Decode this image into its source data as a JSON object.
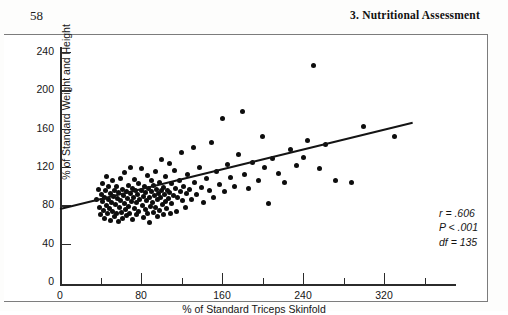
{
  "running_head": {
    "page_number": "58",
    "chapter_title": "3.  Nutritional Assessment"
  },
  "chart_data": {
    "type": "scatter",
    "title": "",
    "xlabel": "% of Standard Triceps Skinfold",
    "ylabel": "% of Standard Weight and Height",
    "xlim": [
      0,
      400
    ],
    "ylim": [
      0,
      240
    ],
    "xticks": [
      0,
      80,
      160,
      240,
      320
    ],
    "xticks_minor": [
      40,
      120,
      200,
      280,
      360
    ],
    "yticks": [
      0,
      40,
      80,
      120,
      160,
      200,
      240
    ],
    "grid": false,
    "legend": null,
    "annotations": {
      "r": "r = .606",
      "p": "P < .001",
      "df": "df = 135"
    },
    "regression_line": {
      "x_start": 0,
      "y_start": 77,
      "x_end": 348,
      "y_end": 167
    },
    "points": [
      [
        36,
        86
      ],
      [
        38,
        97
      ],
      [
        39,
        78
      ],
      [
        40,
        70
      ],
      [
        41,
        91
      ],
      [
        42,
        84
      ],
      [
        42,
        103
      ],
      [
        43,
        75
      ],
      [
        44,
        88
      ],
      [
        44,
        66
      ],
      [
        45,
        95
      ],
      [
        46,
        80
      ],
      [
        46,
        110
      ],
      [
        47,
        72
      ],
      [
        48,
        86
      ],
      [
        48,
        100
      ],
      [
        49,
        77
      ],
      [
        50,
        92
      ],
      [
        50,
        64
      ],
      [
        51,
        83
      ],
      [
        52,
        106
      ],
      [
        52,
        74
      ],
      [
        53,
        89
      ],
      [
        54,
        96
      ],
      [
        54,
        68
      ],
      [
        55,
        81
      ],
      [
        56,
        100
      ],
      [
        56,
        71
      ],
      [
        57,
        87
      ],
      [
        58,
        93
      ],
      [
        58,
        63
      ],
      [
        59,
        78
      ],
      [
        60,
        108
      ],
      [
        60,
        85
      ],
      [
        61,
        73
      ],
      [
        62,
        97
      ],
      [
        62,
        66
      ],
      [
        63,
        90
      ],
      [
        64,
        82
      ],
      [
        64,
        114
      ],
      [
        65,
        76
      ],
      [
        66,
        94
      ],
      [
        66,
        69
      ],
      [
        67,
        87
      ],
      [
        68,
        101
      ],
      [
        68,
        79
      ],
      [
        69,
        72
      ],
      [
        70,
        92
      ],
      [
        70,
        120
      ],
      [
        71,
        84
      ],
      [
        72,
        98
      ],
      [
        72,
        65
      ],
      [
        73,
        88
      ],
      [
        74,
        77
      ],
      [
        74,
        107
      ],
      [
        75,
        95
      ],
      [
        76,
        83
      ],
      [
        76,
        70
      ],
      [
        77,
        91
      ],
      [
        78,
        103
      ],
      [
        78,
        74
      ],
      [
        79,
        86
      ],
      [
        80,
        118
      ],
      [
        80,
        96
      ],
      [
        81,
        80
      ],
      [
        82,
        89
      ],
      [
        82,
        67
      ],
      [
        83,
        100
      ],
      [
        84,
        93
      ],
      [
        84,
        76
      ],
      [
        85,
        85
      ],
      [
        86,
        111
      ],
      [
        86,
        71
      ],
      [
        87,
        98
      ],
      [
        88,
        88
      ],
      [
        88,
        62
      ],
      [
        89,
        79
      ],
      [
        90,
        106
      ],
      [
        90,
        94
      ],
      [
        91,
        83
      ],
      [
        92,
        73
      ],
      [
        92,
        101
      ],
      [
        93,
        90
      ],
      [
        94,
        115
      ],
      [
        94,
        78
      ],
      [
        95,
        97
      ],
      [
        96,
        86
      ],
      [
        96,
        68
      ],
      [
        97,
        92
      ],
      [
        98,
        104
      ],
      [
        98,
        75
      ],
      [
        99,
        88
      ],
      [
        100,
        128
      ],
      [
        100,
        95
      ],
      [
        101,
        81
      ],
      [
        102,
        99
      ],
      [
        102,
        70
      ],
      [
        103,
        91
      ],
      [
        104,
        110
      ],
      [
        104,
        84
      ],
      [
        105,
        77
      ],
      [
        106,
        96
      ],
      [
        107,
        87
      ],
      [
        108,
        124
      ],
      [
        108,
        93
      ],
      [
        109,
        72
      ],
      [
        110,
        103
      ],
      [
        110,
        82
      ],
      [
        112,
        90
      ],
      [
        113,
        116
      ],
      [
        114,
        98
      ],
      [
        115,
        74
      ],
      [
        116,
        88
      ],
      [
        118,
        106
      ],
      [
        119,
        94
      ],
      [
        120,
        135
      ],
      [
        121,
        85
      ],
      [
        122,
        100
      ],
      [
        124,
        78
      ],
      [
        125,
        92
      ],
      [
        126,
        112
      ],
      [
        128,
        97
      ],
      [
        130,
        86
      ],
      [
        132,
        140
      ],
      [
        133,
        104
      ],
      [
        135,
        91
      ],
      [
        138,
        120
      ],
      [
        140,
        99
      ],
      [
        142,
        83
      ],
      [
        145,
        108
      ],
      [
        148,
        96
      ],
      [
        150,
        146
      ],
      [
        152,
        88
      ],
      [
        155,
        115
      ],
      [
        158,
        102
      ],
      [
        160,
        171
      ],
      [
        162,
        94
      ],
      [
        165,
        123
      ],
      [
        168,
        109
      ],
      [
        172,
        100
      ],
      [
        176,
        133
      ],
      [
        180,
        178
      ],
      [
        182,
        112
      ],
      [
        186,
        98
      ],
      [
        190,
        125
      ],
      [
        196,
        106
      ],
      [
        200,
        152
      ],
      [
        202,
        119
      ],
      [
        206,
        82
      ],
      [
        210,
        129
      ],
      [
        216,
        113
      ],
      [
        222,
        104
      ],
      [
        228,
        138
      ],
      [
        234,
        122
      ],
      [
        240,
        130
      ],
      [
        244,
        148
      ],
      [
        250,
        226
      ],
      [
        256,
        118
      ],
      [
        262,
        143
      ],
      [
        272,
        106
      ],
      [
        288,
        104
      ],
      [
        300,
        162
      ],
      [
        330,
        152
      ]
    ]
  }
}
